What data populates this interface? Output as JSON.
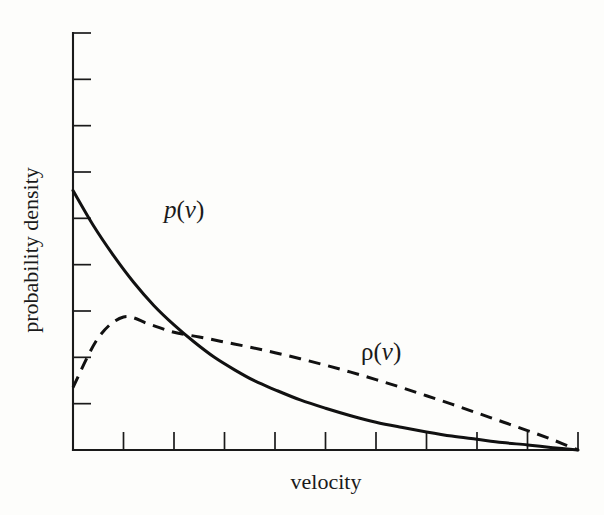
{
  "chart_data": {
    "type": "line",
    "title": "",
    "subtitle": "",
    "xlabel": "velocity",
    "ylabel": "probability density",
    "xlim": [
      0,
      10
    ],
    "ylim": [
      0,
      9
    ],
    "grid": false,
    "legend_position": "inline-annotation",
    "x_tick_count": 10,
    "y_tick_count": 9,
    "x_tick_labels": [
      "",
      "",
      "",
      "",
      "",
      "",
      "",
      "",
      "",
      ""
    ],
    "y_tick_labels": [
      "",
      "",
      "",
      "",
      "",
      "",
      "",
      "",
      ""
    ],
    "annotations": [
      {
        "name": "p-of-v",
        "text": "p(v)",
        "symbol": "p",
        "arg": "v",
        "x": 2.2,
        "y": 5.0
      },
      {
        "name": "rho-of-v",
        "text": "ρ(v)",
        "symbol": "ρ",
        "arg": "v",
        "x": 6.1,
        "y": 1.95
      }
    ],
    "series": [
      {
        "name": "p(v)",
        "label": "p(v)",
        "style": "solid",
        "color": "#111111",
        "x": [
          0.0,
          0.4,
          0.8,
          1.2,
          1.6,
          2.0,
          2.4,
          2.8,
          3.2,
          3.6,
          4.0,
          4.5,
          5.0,
          5.5,
          6.0,
          6.5,
          7.0,
          7.5,
          8.0,
          8.5,
          9.0,
          9.5,
          10.0
        ],
        "y": [
          5.6,
          4.85,
          4.2,
          3.62,
          3.12,
          2.7,
          2.33,
          2.0,
          1.73,
          1.49,
          1.3,
          1.08,
          0.9,
          0.74,
          0.6,
          0.49,
          0.39,
          0.3,
          0.23,
          0.16,
          0.11,
          0.05,
          0.0
        ]
      },
      {
        "name": "ρ(v)",
        "label": "ρ(v)",
        "style": "dashed",
        "color": "#111111",
        "x": [
          0.0,
          0.5,
          1.0,
          1.5,
          2.0,
          2.5,
          3.0,
          3.5,
          4.0,
          4.5,
          5.0,
          5.5,
          6.0,
          6.5,
          7.0,
          7.5,
          8.0,
          8.5,
          9.0,
          9.5,
          10.0
        ],
        "y": [
          1.35,
          2.42,
          2.87,
          2.72,
          2.54,
          2.44,
          2.33,
          2.22,
          2.1,
          1.97,
          1.83,
          1.68,
          1.52,
          1.35,
          1.17,
          0.99,
          0.8,
          0.61,
          0.42,
          0.22,
          0.0
        ]
      }
    ],
    "crossing_point": {
      "x": 2.08,
      "y": 2.52
    }
  },
  "figure": {
    "background_color": "#fdfdfb",
    "axis_color": "#1a1a1a",
    "tick_direction": "inward"
  }
}
